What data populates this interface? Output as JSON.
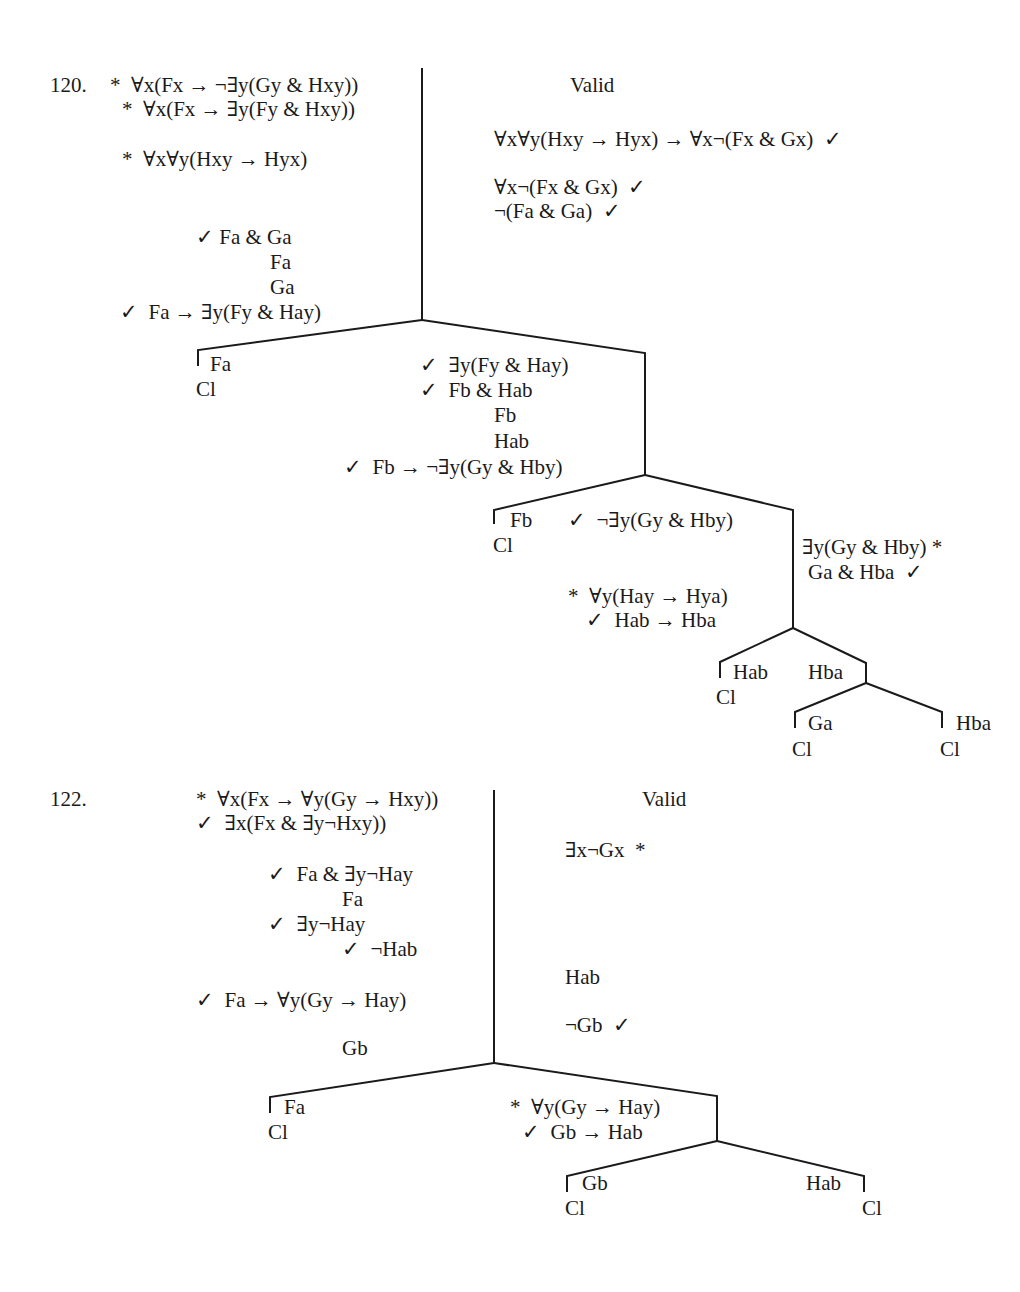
{
  "problems": [
    {
      "number": "120.",
      "status": "Valid",
      "left_column": [
        "*  ∀x(Fx → ¬∃y(Gy & Hxy))",
        "*  ∀x(Fx → ∃y(Fy & Hxy))",
        "*  ∀x∀y(Hxy → Hyx)",
        "✓ Fa & Ga",
        "Fa",
        "Ga",
        "✓  Fa → ∃y(Fy & Hay)"
      ],
      "right_column": [
        "∀x∀y(Hxy → Hyx) → ∀x¬(Fx & Gx)  ✓",
        "∀x¬(Fx & Gx)  ✓",
        "¬(Fa & Ga)  ✓"
      ],
      "branches": {
        "b1_left": [
          "Fa",
          "Cl"
        ],
        "b1_right": [
          "✓  ∃y(Fy & Hay)",
          "✓  Fb & Hab",
          "Fb",
          "Hab",
          "✓  Fb → ¬∃y(Gy & Hby)"
        ],
        "b2_left": [
          "Fb",
          "Cl"
        ],
        "b2_middle": [
          "✓  ¬∃y(Gy & Hby)",
          "*  ∀y(Hay → Hya)",
          "✓  Hab → Hba"
        ],
        "b2_right": [
          "∃y(Gy & Hby) *",
          "Ga & Hba  ✓"
        ],
        "b3_left": [
          "Hab",
          "Cl"
        ],
        "b3_right": [
          "Hba"
        ],
        "b4_left": [
          "Ga",
          "Cl"
        ],
        "b4_right": [
          "Hba",
          "Cl"
        ]
      }
    },
    {
      "number": "122.",
      "status": "Valid",
      "left_column": [
        "*  ∀x(Fx → ∀y(Gy → Hxy))",
        "✓  ∃x(Fx & ∃y¬Hxy))",
        "✓  Fa & ∃y¬Hay",
        "Fa",
        "✓  ∃y¬Hay",
        "✓  ¬Hab",
        "✓  Fa → ∀y(Gy → Hay)",
        "Gb"
      ],
      "right_column": [
        "∃x¬Gx  *",
        "Hab",
        "¬Gb  ✓"
      ],
      "branches": {
        "b1_left": [
          "Fa",
          "Cl"
        ],
        "b1_right": [
          "*  ∀y(Gy → Hay)",
          "✓  Gb → Hab"
        ],
        "b2_left": [
          "Gb",
          "Cl"
        ],
        "b2_right": [
          "Hab",
          "Cl"
        ]
      }
    }
  ]
}
